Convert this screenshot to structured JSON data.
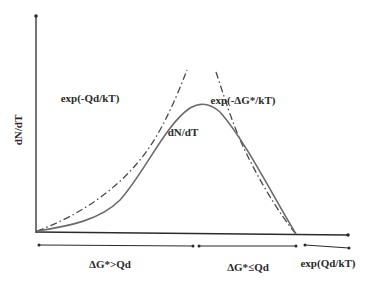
{
  "diagram": {
    "type": "schematic-curve",
    "y_axis_label": "dN/dT",
    "curves": [
      {
        "name": "exp(-Qd/kT)",
        "style": "dash-dot",
        "label": "exp(-Qd/kT)",
        "description": "rising branch, increases toward peak"
      },
      {
        "name": "exp(-ΔG*/kT)",
        "style": "dash-dot",
        "label": "exp(-ΔG*/kT)",
        "description": "falling branch, decreases to zero"
      },
      {
        "name": "dN/dT",
        "style": "solid",
        "label": "dN/dT",
        "description": "bell-shaped nucleation rate curve"
      }
    ],
    "regions": [
      {
        "label": "ΔG*>Qd",
        "range": "left"
      },
      {
        "label": "ΔG*≤Qd",
        "range": "middle"
      },
      {
        "label": "exp(Qd/kT)",
        "range": "right"
      }
    ],
    "colors": {
      "axis": "#2b2b2b",
      "solid_curve": "#6b6b6b",
      "dashdot_curve": "#4a4a4a",
      "text": "#2a2a2a"
    }
  }
}
